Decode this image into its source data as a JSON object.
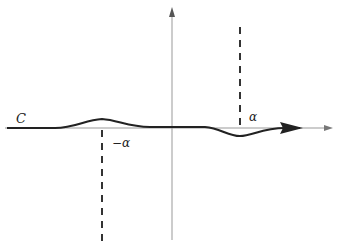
{
  "diagram": {
    "type": "contour-integration-path",
    "contour_label": "C",
    "points": [
      {
        "name": "minus-alpha",
        "label": "−α",
        "position": "left of origin, contour bulges above real axis"
      },
      {
        "name": "alpha",
        "label": "α",
        "position": "right of origin, contour dips below real axis"
      }
    ],
    "colors": {
      "axis": "#888888",
      "contour": "#222222",
      "dashed": "#333333"
    }
  }
}
